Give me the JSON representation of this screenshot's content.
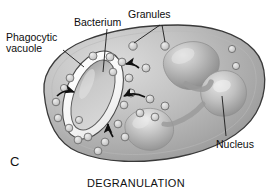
{
  "figure": {
    "panel_letter": "C",
    "caption": "DEGRANULATION",
    "labels": {
      "bacterium": "Bacterium",
      "granules": "Granules",
      "phagocytic_vacuole_line1": "Phagocytic",
      "phagocytic_vacuole_line2": "vacuole",
      "nucleus": "Nucleus"
    },
    "colors": {
      "background": "#ffffff",
      "cytoplasm_light": "#d8d8d8",
      "cytoplasm_mid": "#b4b4b4",
      "cytoplasm_dark": "#8e8e8e",
      "membrane_outline": "#3a3a3a",
      "nucleus_light": "#d2d2d2",
      "nucleus_mid": "#a8a8a8",
      "nucleus_dark": "#7d7d7d",
      "vacuole_white": "#fbfbfb",
      "bacterium_fill": "#c6c6c6",
      "granule_fill": "#cfcfcf",
      "granule_stroke": "#6e6e6e",
      "leader_line": "#1a1a1a",
      "arrow": "#101010",
      "text": "#0d0d0d"
    },
    "structures": [
      {
        "name": "cell-body",
        "description": "irregular rounded phagocytic cell outline"
      },
      {
        "name": "phagocytic-vacuole",
        "description": "white elongated oval enclosing bacterium"
      },
      {
        "name": "bacterium",
        "description": "gray rod inside vacuole"
      },
      {
        "name": "nucleus",
        "description": "multi-lobed polymorphonuclear nucleus, three lobes"
      },
      {
        "name": "granules",
        "description": "small circular granules scattered in cytoplasm"
      },
      {
        "name": "fusion-arrows",
        "description": "curved arrows showing granules migrating to fuse with vacuole"
      }
    ],
    "granule_count": 28,
    "nucleus_lobes": 3,
    "arrow_count": 4
  }
}
